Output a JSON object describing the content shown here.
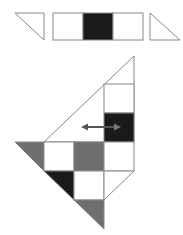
{
  "colors": {
    "stroke": "#888888",
    "white": "#ffffff",
    "black": "#1a1a1a",
    "gray": "#6e6e6e",
    "arrow": "#555555"
  },
  "top_row": {
    "left_triangle": "white",
    "strip": [
      "white",
      "black",
      "white"
    ],
    "right_triangle": "white"
  },
  "main_figure": {
    "column_cells": [
      "white",
      "black"
    ],
    "row1": [
      "white",
      "gray",
      "white"
    ],
    "row2": [
      "white"
    ],
    "triangles": {
      "left_edge_top": "gray",
      "left_edge_middle": "black",
      "bottom": "gray",
      "right_lower": "white"
    },
    "arrow": "double-headed horizontal arrow"
  }
}
